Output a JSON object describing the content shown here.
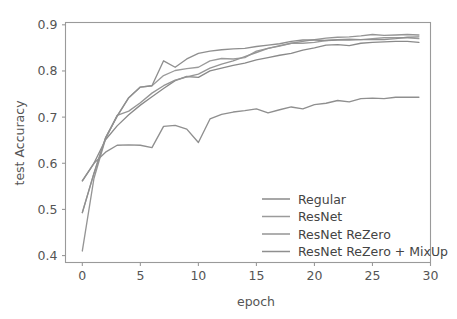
{
  "chart_data": {
    "type": "line",
    "title": "",
    "xlabel": "epoch",
    "ylabel": "test Accuracy",
    "xlim": [
      -1.45,
      30.0
    ],
    "ylim": [
      0.385,
      0.905
    ],
    "xticks": [
      0,
      5,
      10,
      15,
      20,
      25,
      30
    ],
    "xtick_labels": [
      "0",
      "5",
      "10",
      "15",
      "20",
      "25",
      "30"
    ],
    "yticks": [
      0.4,
      0.5,
      0.6,
      0.7,
      0.8,
      0.9
    ],
    "ytick_labels": [
      "0.4",
      "0.5",
      "0.6",
      "0.7",
      "0.8",
      "0.9"
    ],
    "grid": false,
    "legend_position": "lower right",
    "legend_frame": false,
    "x": [
      0,
      1,
      2,
      3,
      4,
      5,
      6,
      7,
      8,
      9,
      10,
      11,
      12,
      13,
      14,
      15,
      16,
      17,
      18,
      19,
      20,
      21,
      22,
      23,
      24,
      25,
      26,
      27,
      28,
      29
    ],
    "series": [
      {
        "name": "Regular",
        "color": "#8a8a8a",
        "values": [
          0.562,
          0.6,
          0.651,
          0.681,
          0.705,
          0.726,
          0.744,
          0.762,
          0.779,
          0.788,
          0.786,
          0.8,
          0.806,
          0.812,
          0.817,
          0.824,
          0.829,
          0.834,
          0.838,
          0.845,
          0.85,
          0.856,
          0.857,
          0.855,
          0.86,
          0.862,
          0.863,
          0.864,
          0.864,
          0.862
        ]
      },
      {
        "name": "ResNet",
        "color": "#9b9b9b",
        "values": [
          0.493,
          0.578,
          0.655,
          0.702,
          0.742,
          0.765,
          0.768,
          0.79,
          0.801,
          0.805,
          0.808,
          0.822,
          0.827,
          0.826,
          0.829,
          0.843,
          0.849,
          0.854,
          0.86,
          0.86,
          0.862,
          0.866,
          0.868,
          0.869,
          0.868,
          0.87,
          0.872,
          0.872,
          0.872,
          0.87
        ]
      },
      {
        "name": "ResNet ReZero",
        "color": "#959595",
        "values": [
          0.41,
          0.567,
          0.653,
          0.704,
          0.713,
          0.731,
          0.752,
          0.768,
          0.78,
          0.787,
          0.793,
          0.806,
          0.815,
          0.822,
          0.831,
          0.84,
          0.849,
          0.855,
          0.86,
          0.864,
          0.868,
          0.871,
          0.873,
          0.874,
          0.876,
          0.879,
          0.877,
          0.878,
          0.879,
          0.878
        ]
      },
      {
        "name": "ResNet ReZero + MixUp",
        "color": "#8f8f8f",
        "values": [
          0.493,
          0.578,
          0.655,
          0.702,
          0.742,
          0.765,
          0.768,
          0.822,
          0.808,
          0.826,
          0.838,
          0.843,
          0.846,
          0.848,
          0.849,
          0.853,
          0.856,
          0.859,
          0.864,
          0.867,
          0.867,
          0.866,
          0.867,
          0.867,
          0.868,
          0.868,
          0.868,
          0.87,
          0.873,
          0.874
        ]
      },
      {
        "name": "MixUp-low",
        "color": "#8f8f8f",
        "values": [
          0.562,
          0.6,
          0.624,
          0.639,
          0.64,
          0.639,
          0.634,
          0.68,
          0.682,
          0.674,
          0.645,
          0.696,
          0.706,
          0.711,
          0.714,
          0.718,
          0.709,
          0.716,
          0.722,
          0.718,
          0.727,
          0.73,
          0.736,
          0.733,
          0.74,
          0.741,
          0.74,
          0.743,
          0.743,
          0.743
        ]
      }
    ]
  },
  "legend": {
    "entries": [
      {
        "label": "Regular",
        "color": "#8a8a8a"
      },
      {
        "label": "ResNet",
        "color": "#9b9b9b"
      },
      {
        "label": "ResNet ReZero",
        "color": "#959595"
      },
      {
        "label": "ResNet ReZero + MixUp",
        "color": "#8f8f8f"
      }
    ]
  },
  "axes": {
    "x_label": "epoch",
    "y_label": "test Accuracy"
  }
}
